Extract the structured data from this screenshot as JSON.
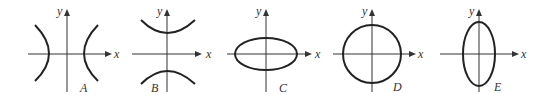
{
  "figure": {
    "panels": [
      {
        "label": "A",
        "shape": "hyperbola opening left-right",
        "x_axis_label": "x",
        "y_axis_label": "y"
      },
      {
        "label": "B",
        "shape": "hyperbola opening up-down",
        "x_axis_label": "x",
        "y_axis_label": "y"
      },
      {
        "label": "C",
        "shape": "horizontal ellipse",
        "x_axis_label": "x",
        "y_axis_label": "y"
      },
      {
        "label": "D",
        "shape": "circle",
        "x_axis_label": "x",
        "y_axis_label": "y"
      },
      {
        "label": "E",
        "shape": "vertical ellipse",
        "x_axis_label": "x",
        "y_axis_label": "y"
      }
    ]
  },
  "colors": {
    "stroke": "#222222",
    "axis": "#333333",
    "background": "#ffffff"
  }
}
